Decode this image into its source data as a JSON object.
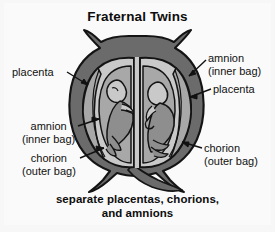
{
  "figure": {
    "title": "Fraternal Twins",
    "caption_line1": "separate placentas, chorions,",
    "caption_line2": "and amnions"
  },
  "labels": {
    "placenta_left": {
      "line1": "placenta"
    },
    "amnion_right": {
      "line1": "amnion",
      "line2": "(inner bag)"
    },
    "placenta_right": {
      "line1": "placenta"
    },
    "amnion_left": {
      "line1": "amnion",
      "line2": "(inner bag)"
    },
    "chorion_left": {
      "line1": "chorion",
      "line2": "(outer bag)"
    },
    "chorion_right": {
      "line1": "chorion",
      "line2": "(outer bag)"
    }
  },
  "colors": {
    "background": "#f7f7f7",
    "panel": "#fafafa",
    "text": "#111111",
    "uterus_wall": "#6b6b6b",
    "uterus_wall_dark": "#5a5a5a",
    "chorion_fill": "#c9c9c9",
    "amnion_fill": "#a8a8a8",
    "fetus_fill": "#8e8e8e",
    "outline": "#141414",
    "leader_line": "#111111"
  }
}
